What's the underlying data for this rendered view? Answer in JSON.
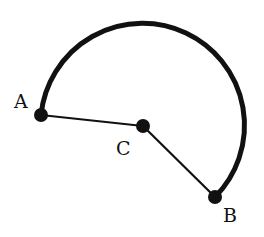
{
  "diagram": {
    "type": "circular-sector-arc",
    "stroke_color": "#111111",
    "background": "#ffffff",
    "center": {
      "label": "C",
      "x": 143,
      "y": 126
    },
    "radius": 102,
    "points": [
      {
        "id": "A",
        "label": "A",
        "x": 41,
        "y": 115,
        "label_x": 14,
        "label_y": 108
      },
      {
        "id": "C",
        "label": "C",
        "x": 143,
        "y": 126,
        "label_x": 116,
        "label_y": 155
      },
      {
        "id": "B",
        "label": "B",
        "x": 215,
        "y": 197,
        "label_x": 223,
        "label_y": 222
      }
    ],
    "segments": [
      {
        "from": "A",
        "to": "C"
      },
      {
        "from": "C",
        "to": "B"
      }
    ],
    "arc": {
      "from": "A",
      "to": "B",
      "direction": "clockwise-over-top",
      "center": "C"
    }
  }
}
